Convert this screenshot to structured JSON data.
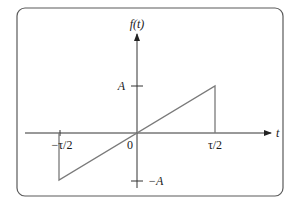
{
  "diagram": {
    "title_label": "f(t)",
    "x_axis_label": "t",
    "tick_labels": {
      "x_neg": "−τ/2",
      "x_zero": "0",
      "x_pos": "τ/2",
      "y_pos": "A",
      "y_neg": "−A"
    },
    "colors": {
      "frame": "#5a5a5a",
      "axis": "#333333",
      "signal": "#7a7a7a"
    }
  },
  "chart_data": {
    "type": "line",
    "title": "f(t)",
    "xlabel": "t",
    "ylabel": "f(t)",
    "x": [
      -1.0,
      -0.5,
      -0.5,
      0.5,
      0.5,
      1.0
    ],
    "y": [
      0,
      0,
      -1,
      1,
      0,
      0
    ],
    "x_units": "τ",
    "y_units": "A",
    "xlim": [
      -1.0,
      1.0
    ],
    "ylim": [
      -1.2,
      1.2
    ],
    "x_tick_labels": [
      "−τ/2",
      "0",
      "τ/2"
    ],
    "y_tick_labels": [
      "A",
      "−A"
    ],
    "grid": false
  }
}
